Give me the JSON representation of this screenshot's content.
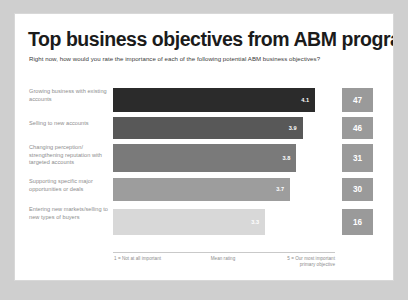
{
  "slide": {
    "title": "Top business objectives from ABM programs",
    "subtitle": "Right now, how would you rate the importance of each of the following potential ABM business objectives?"
  },
  "chart_data": {
    "type": "bar",
    "orientation": "horizontal",
    "title": "Top business objectives from ABM programs",
    "subtitle": "Right now, how would you rate the importance of each of the following potential ABM business objectives?",
    "xlabel": "Mean rating",
    "ylabel": "",
    "xlim": [
      1,
      5
    ],
    "grid": false,
    "legend": null,
    "categories": [
      "Growing business with existing accounts",
      "Selling to new accounts",
      "Changing perception/ strengthening reputation with targeted accounts",
      "Supporting specific major opportunities or deals",
      "Entering new markets/selling to new types of buyers"
    ],
    "values": [
      4.1,
      3.9,
      3.8,
      3.7,
      3.3
    ],
    "value_labels": [
      "4.1",
      "3.9",
      "3.8",
      "3.7",
      "3.3"
    ],
    "secondary_series": {
      "name": "Percent rating 5 = our most important primary objective",
      "values": [
        47,
        46,
        31,
        30,
        16
      ],
      "labels": [
        "47",
        "46",
        "31",
        "30",
        "16"
      ]
    },
    "bar_colors": [
      "#2b2b2b",
      "#585858",
      "#7a7a7a",
      "#9d9d9d",
      "#d8d8d8"
    ],
    "axis_scale_min_label": "1 = Not at all important",
    "axis_scale_mid_label": "Mean rating",
    "axis_scale_max_label": "5 = Our most important primary objective"
  },
  "axis": {
    "left": "1 = Not at all important",
    "mid": "Mean rating",
    "right": "5 = Our most important primary objective"
  }
}
